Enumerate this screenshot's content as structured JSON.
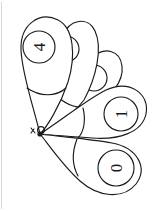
{
  "figure": {
    "background_color": "#ffffff",
    "stroke_color": "#1a1a1a",
    "frame_color": "#d8d8d8",
    "canvas": {
      "width": 162,
      "height": 211
    },
    "pivot": {
      "x": 40,
      "y": 134,
      "label": "pivot-point"
    },
    "pivot_marks": {
      "tick_label": "b",
      "dot_label": "o"
    },
    "petals": [
      {
        "id": "petal-0",
        "name": "petal-four",
        "digit": "4",
        "digit_visible": true,
        "digit_rotation_deg": -90,
        "label_center": {
          "x": 39,
          "y": 47
        },
        "label_radius": 16,
        "angle_deg": -103,
        "occluded": false
      },
      {
        "id": "petal-1",
        "name": "petal-hidden-upper",
        "digit": "",
        "digit_visible": false,
        "digit_rotation_deg": -90,
        "label_center": {
          "x": 66,
          "y": 49
        },
        "label_radius": 13,
        "angle_deg": -88,
        "occluded": true
      },
      {
        "id": "petal-2",
        "name": "petal-hidden-mid",
        "digit": "",
        "digit_visible": false,
        "digit_rotation_deg": -90,
        "label_center": {
          "x": 85,
          "y": 55
        },
        "label_radius": 13,
        "angle_deg": -72,
        "occluded": true
      },
      {
        "id": "petal-3",
        "name": "petal-one",
        "digit": "1",
        "digit_visible": true,
        "digit_rotation_deg": -90,
        "label_center": {
          "x": 121,
          "y": 106
        },
        "label_radius": 17,
        "angle_deg": -22,
        "occluded": false
      },
      {
        "id": "petal-4",
        "name": "petal-zero",
        "digit": "0",
        "digit_visible": true,
        "digit_rotation_deg": -90,
        "label_center": {
          "x": 116,
          "y": 163
        },
        "label_radius": 18,
        "angle_deg": 22,
        "occluded": false
      }
    ]
  }
}
